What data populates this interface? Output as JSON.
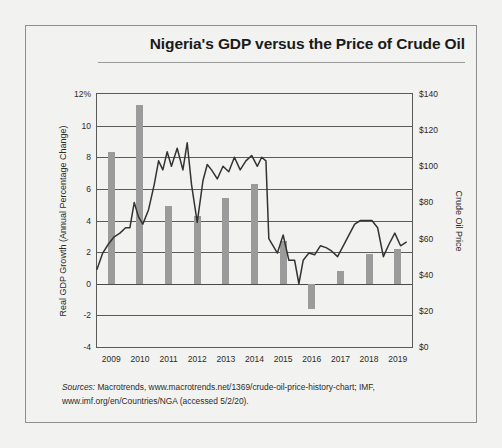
{
  "title": "Nigeria's GDP versus the Price of Crude Oil",
  "axis_left_label": "Real GDP Growth (Annual Percentage Change)",
  "axis_right_label": "Crude Oil Price",
  "sources_prefix": "Sources:",
  "sources_text": " Macrotrends, www.macrotrends.net/1369/crude-oil-price-history-chart; IMF, www.imf.org/en/Countries/NGA (accessed 5/2/20).",
  "colors": {
    "background": "#f2f2f0",
    "bar": "#9b9b9b",
    "line": "#333333",
    "axis": "#5a5a5a",
    "text": "#2b2b2b"
  },
  "chart_data": {
    "type": "bar",
    "title": "Nigeria's GDP versus the Price of Crude Oil",
    "xlabel": "",
    "ylabel": "Real GDP Growth (Annual Percentage Change)",
    "y2label": "Crude Oil Price",
    "categories": [
      "2009",
      "2010",
      "2011",
      "2012",
      "2013",
      "2014",
      "2015",
      "2016",
      "2017",
      "2018",
      "2019"
    ],
    "ylim": [
      -4,
      12
    ],
    "yticks": [
      -4,
      -2,
      0,
      2,
      4,
      6,
      8,
      10,
      12
    ],
    "ytick_labels": [
      "-4",
      "-2",
      "0",
      "2",
      "4",
      "6",
      "8",
      "10",
      "12%"
    ],
    "y2lim": [
      0,
      140
    ],
    "y2ticks": [
      0,
      20,
      40,
      60,
      80,
      100,
      120,
      140
    ],
    "y2tick_labels": [
      "$0",
      "$20",
      "$40",
      "$60",
      "$80",
      "$100",
      "$120",
      "$140"
    ],
    "grid": true,
    "legend": "none",
    "series": [
      {
        "name": "Real GDP Growth (Annual Percentage Change)",
        "type": "bar",
        "axis": "left",
        "values": [
          8.35,
          11.3,
          4.9,
          4.3,
          5.4,
          6.3,
          2.7,
          -1.6,
          0.8,
          1.9,
          2.2
        ]
      },
      {
        "name": "Crude Oil Price",
        "type": "line",
        "axis": "right",
        "x": [
          2009.0,
          2009.2,
          2009.4,
          2009.6,
          2009.8,
          2010.0,
          2010.15,
          2010.3,
          2010.45,
          2010.6,
          2010.8,
          2011.0,
          2011.15,
          2011.3,
          2011.45,
          2011.6,
          2011.8,
          2012.0,
          2012.15,
          2012.3,
          2012.5,
          2012.7,
          2012.85,
          2013.0,
          2013.2,
          2013.4,
          2013.6,
          2013.8,
          2014.0,
          2014.2,
          2014.4,
          2014.6,
          2014.75,
          2014.9,
          2015.0,
          2015.15,
          2015.3,
          2015.5,
          2015.7,
          2015.9,
          2016.05,
          2016.2,
          2016.4,
          2016.6,
          2016.8,
          2017.0,
          2017.2,
          2017.4,
          2017.6,
          2017.8,
          2018.0,
          2018.2,
          2018.4,
          2018.6,
          2018.8,
          2019.0,
          2019.2,
          2019.4,
          2019.6,
          2019.8
        ],
        "y": [
          43,
          52,
          57,
          61,
          63,
          66,
          66,
          80,
          72,
          68,
          76,
          90,
          103,
          98,
          108,
          100,
          110,
          98,
          113,
          90,
          69,
          92,
          101,
          98,
          93,
          100,
          97,
          105,
          98,
          103,
          106,
          100,
          105,
          103,
          60,
          56,
          52,
          62,
          48,
          48,
          35,
          48,
          52,
          51,
          56,
          55,
          53,
          50,
          56,
          62,
          68,
          70,
          70,
          70,
          66,
          50,
          57,
          63,
          56,
          58
        ]
      }
    ]
  }
}
